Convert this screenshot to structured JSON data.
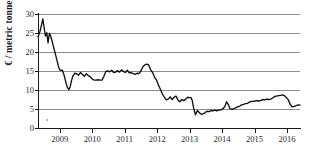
{
  "chart_data": {
    "type": "line",
    "title": "",
    "subtitle": "",
    "xlabel": "",
    "ylabel": "€ / metric tonne",
    "ylim": [
      0,
      30
    ],
    "xlim": [
      2008.33,
      2016.4
    ],
    "grid": true,
    "legend": false,
    "legend_position": "none",
    "line_color": "#111111",
    "grid_color": "#8d8d8d",
    "axis_color": "#1a1a1a",
    "y_ticks": [
      0,
      5,
      10,
      15,
      20,
      25,
      30
    ],
    "y_tick_labels": [
      "0",
      "5",
      "10",
      "15",
      "20",
      "25",
      "30"
    ],
    "x_ticks": [
      2009,
      2010,
      2011,
      2012,
      2013,
      2014,
      2015,
      2016
    ],
    "x_tick_labels": [
      "2009",
      "2010",
      "2011",
      "2012",
      "2013",
      "2014",
      "2015",
      "2016"
    ],
    "series": [
      {
        "name": "EU carbon price",
        "x": [
          2008.33,
          2008.39,
          2008.44,
          2008.48,
          2008.52,
          2008.56,
          2008.6,
          2008.64,
          2008.68,
          2008.72,
          2008.76,
          2008.8,
          2008.84,
          2008.88,
          2008.92,
          2008.96,
          2009.0,
          2009.04,
          2009.08,
          2009.12,
          2009.16,
          2009.2,
          2009.24,
          2009.28,
          2009.32,
          2009.36,
          2009.4,
          2009.46,
          2009.52,
          2009.58,
          2009.64,
          2009.7,
          2009.76,
          2009.82,
          2009.88,
          2009.94,
          2010.0,
          2010.06,
          2010.12,
          2010.18,
          2010.24,
          2010.3,
          2010.36,
          2010.42,
          2010.48,
          2010.54,
          2010.6,
          2010.66,
          2010.72,
          2010.78,
          2010.84,
          2010.9,
          2010.96,
          2011.02,
          2011.08,
          2011.14,
          2011.2,
          2011.26,
          2011.32,
          2011.38,
          2011.44,
          2011.5,
          2011.56,
          2011.62,
          2011.68,
          2011.74,
          2011.8,
          2011.86,
          2011.92,
          2011.98,
          2012.04,
          2012.1,
          2012.16,
          2012.22,
          2012.28,
          2012.34,
          2012.4,
          2012.46,
          2012.52,
          2012.58,
          2012.64,
          2012.7,
          2012.76,
          2012.82,
          2012.88,
          2012.94,
          2013.0,
          2013.04,
          2013.08,
          2013.12,
          2013.18,
          2013.24,
          2013.3,
          2013.36,
          2013.42,
          2013.48,
          2013.54,
          2013.6,
          2013.66,
          2013.72,
          2013.78,
          2013.84,
          2013.9,
          2013.96,
          2014.02,
          2014.08,
          2014.14,
          2014.2,
          2014.24,
          2014.3,
          2014.36,
          2014.42,
          2014.48,
          2014.54,
          2014.6,
          2014.66,
          2014.72,
          2014.78,
          2014.84,
          2014.9,
          2014.96,
          2015.02,
          2015.08,
          2015.14,
          2015.2,
          2015.26,
          2015.32,
          2015.38,
          2015.44,
          2015.5,
          2015.56,
          2015.62,
          2015.68,
          2015.74,
          2015.8,
          2015.86,
          2015.92,
          2015.98,
          2016.04,
          2016.1,
          2016.16,
          2016.22,
          2016.28,
          2016.34,
          2016.4
        ],
        "y": [
          24.0,
          25.4,
          27.2,
          28.7,
          26.3,
          24.2,
          25.1,
          22.4,
          24.9,
          24.2,
          23.0,
          21.6,
          20.3,
          19.0,
          17.6,
          16.2,
          15.3,
          15.2,
          15.2,
          14.3,
          13.0,
          11.6,
          10.6,
          10.1,
          10.8,
          12.4,
          13.6,
          14.4,
          14.3,
          13.9,
          14.6,
          14.1,
          13.6,
          14.3,
          13.8,
          13.5,
          12.9,
          12.6,
          12.6,
          12.7,
          12.6,
          12.6,
          13.6,
          14.9,
          15.0,
          14.8,
          15.2,
          14.6,
          14.7,
          15.1,
          14.7,
          15.3,
          14.9,
          14.6,
          15.2,
          14.5,
          14.6,
          14.3,
          14.1,
          14.4,
          14.3,
          15.0,
          16.1,
          16.6,
          16.8,
          16.6,
          15.3,
          14.6,
          13.4,
          12.6,
          11.3,
          10.2,
          9.0,
          8.1,
          7.4,
          7.6,
          8.2,
          7.5,
          8.1,
          8.4,
          7.4,
          6.9,
          7.5,
          7.2,
          7.6,
          8.1,
          8.0,
          8.0,
          7.3,
          5.4,
          3.5,
          4.6,
          4.0,
          3.6,
          3.7,
          4.1,
          4.4,
          4.3,
          4.6,
          4.5,
          4.7,
          4.5,
          4.7,
          4.8,
          5.0,
          5.6,
          6.9,
          6.0,
          5.1,
          4.9,
          5.1,
          5.3,
          5.6,
          5.7,
          6.1,
          6.2,
          6.4,
          6.5,
          6.8,
          7.0,
          7.0,
          7.1,
          7.2,
          7.1,
          7.3,
          7.5,
          7.4,
          7.6,
          7.5,
          7.6,
          7.9,
          8.3,
          8.4,
          8.5,
          8.6,
          8.7,
          8.5,
          8.0,
          7.4,
          6.2,
          5.6,
          5.7,
          5.9,
          6.1,
          6.0
        ]
      }
    ]
  },
  "axes": {
    "y_title": "€ / metric tonne"
  }
}
